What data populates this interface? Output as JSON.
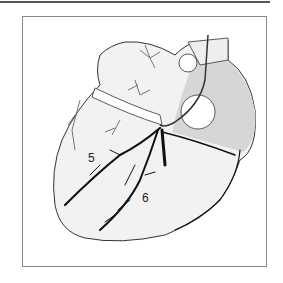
{
  "figure": {
    "labels": [
      {
        "id": "label-5",
        "text": "5"
      },
      {
        "id": "label-6",
        "text": "6"
      }
    ],
    "colors": {
      "frame": "#888888",
      "outline": "#333333",
      "shade": "#d8d8d8",
      "vessel": "#111111"
    }
  }
}
